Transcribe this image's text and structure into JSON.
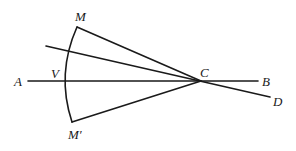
{
  "diagram": {
    "type": "geometry",
    "labels": {
      "M": "M",
      "M_prime": "M′",
      "A": "A",
      "V": "V",
      "C": "C",
      "B": "B",
      "D": "D"
    },
    "points": {
      "M": [
        77,
        27
      ],
      "M_prime": [
        72,
        122
      ],
      "C": [
        201,
        81
      ],
      "A_end": [
        28,
        81
      ],
      "B_end": [
        258,
        81
      ],
      "V": [
        65,
        81
      ],
      "D_start": [
        46,
        46
      ],
      "D_end": [
        270,
        97
      ]
    },
    "stroke_color": "#1a1a1a",
    "background": "#ffffff"
  }
}
